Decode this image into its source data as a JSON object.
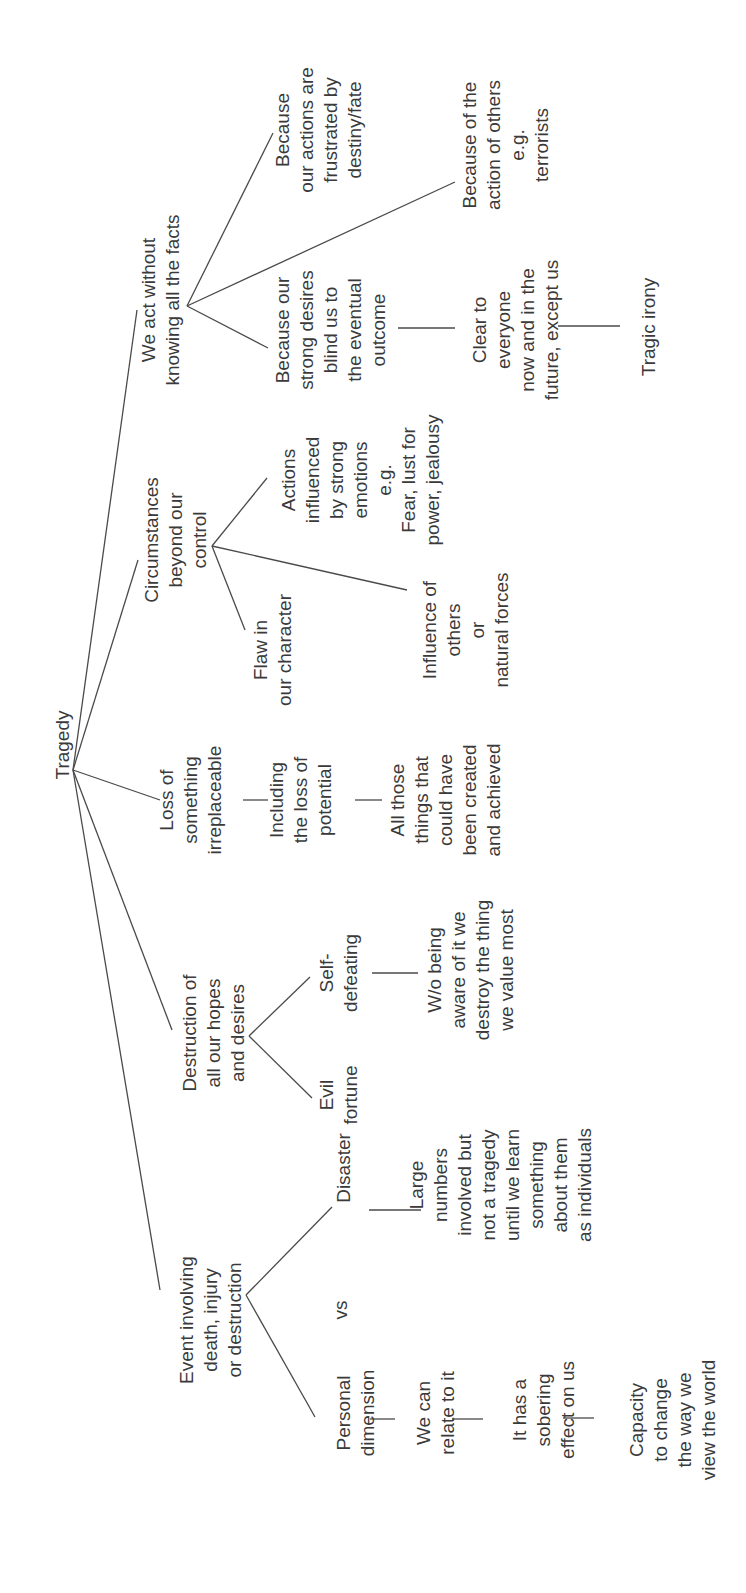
{
  "title": "Tragedy",
  "colors": {
    "ink": "#3a3a3a",
    "line": "#4a4a4a",
    "background": "#ffffff"
  },
  "orientation": "rotated-90-ccw",
  "nodes": [
    {
      "id": "root",
      "lines": [
        "Tragedy"
      ],
      "x": 62,
      "y": 745
    },
    {
      "id": "we-act",
      "lines": [
        "We act without",
        "knowing all the facts"
      ],
      "x": 160,
      "y": 300
    },
    {
      "id": "because-actions",
      "lines": [
        "Because",
        "our actions are",
        "frustrated by",
        "destiny/fate"
      ],
      "x": 318,
      "y": 130
    },
    {
      "id": "because-others",
      "lines": [
        "Because of the",
        "action of others",
        "e.g.",
        "terrorists"
      ],
      "x": 505,
      "y": 145
    },
    {
      "id": "because-desires",
      "lines": [
        "Because our",
        "strong desires",
        "blind us to",
        "the eventual",
        "outcome"
      ],
      "x": 330,
      "y": 330
    },
    {
      "id": "clear-to-everyone",
      "lines": [
        "Clear to",
        "everyone",
        "now and in the",
        "future, except us"
      ],
      "x": 515,
      "y": 330
    },
    {
      "id": "tragic-irony",
      "lines": [
        "Tragic irony"
      ],
      "x": 648,
      "y": 327
    },
    {
      "id": "circumstances",
      "lines": [
        "Circumstances",
        "beyond our",
        "control"
      ],
      "x": 175,
      "y": 540
    },
    {
      "id": "actions-influenced",
      "lines": [
        "Actions",
        "influenced",
        "by strong",
        "emotions",
        "e.g.",
        "Fear, lust for",
        "power, jealousy"
      ],
      "x": 360,
      "y": 480
    },
    {
      "id": "flaw",
      "lines": [
        "Flaw in",
        "our character"
      ],
      "x": 272,
      "y": 650
    },
    {
      "id": "influence-others",
      "lines": [
        "Influence of",
        "others",
        "or",
        "natural forces"
      ],
      "x": 465,
      "y": 630
    },
    {
      "id": "loss",
      "lines": [
        "Loss of",
        "something",
        "irreplaceable"
      ],
      "x": 190,
      "y": 800
    },
    {
      "id": "including-loss",
      "lines": [
        "Including",
        "the loss of",
        "potential"
      ],
      "x": 300,
      "y": 800
    },
    {
      "id": "all-those",
      "lines": [
        "All those",
        "things that",
        "could have",
        "been created",
        "and achieved"
      ],
      "x": 445,
      "y": 800
    },
    {
      "id": "destruction",
      "lines": [
        "Destruction of",
        "all our hopes",
        "and desires"
      ],
      "x": 213,
      "y": 1033
    },
    {
      "id": "self-defeating",
      "lines": [
        "Self-",
        "defeating"
      ],
      "x": 338,
      "y": 973
    },
    {
      "id": "evil-fortune",
      "lines": [
        "Evil",
        "fortune"
      ],
      "x": 338,
      "y": 1095
    },
    {
      "id": "wo-being-aware",
      "lines": [
        "W/o being",
        "aware of it we",
        "destroy the thing",
        "we value most"
      ],
      "x": 470,
      "y": 970
    },
    {
      "id": "event",
      "lines": [
        "Event involving",
        "death, injury",
        "or destruction"
      ],
      "x": 210,
      "y": 1320
    },
    {
      "id": "disaster",
      "lines": [
        "Disaster"
      ],
      "x": 343,
      "y": 1168
    },
    {
      "id": "vs",
      "lines": [
        "vs"
      ],
      "x": 340,
      "y": 1310
    },
    {
      "id": "large-numbers",
      "lines": [
        "Large",
        "numbers",
        "involved but",
        "not a tragedy",
        "until we learn",
        "something",
        "about them",
        "as individuals"
      ],
      "x": 500,
      "y": 1185
    },
    {
      "id": "personal-dimension",
      "lines": [
        "Personal",
        "dimension"
      ],
      "x": 355,
      "y": 1413
    },
    {
      "id": "we-can-relate",
      "lines": [
        "We can",
        "relate to it"
      ],
      "x": 435,
      "y": 1413
    },
    {
      "id": "sobering",
      "lines": [
        "It has a",
        "sobering",
        "effect on us"
      ],
      "x": 543,
      "y": 1410
    },
    {
      "id": "capacity",
      "lines": [
        "Capacity",
        "to change",
        "the way we",
        "view the world"
      ],
      "x": 672,
      "y": 1420
    }
  ],
  "edges": [
    [
      73,
      770,
      137,
      310
    ],
    [
      73,
      770,
      138,
      560
    ],
    [
      73,
      770,
      160,
      800
    ],
    [
      73,
      770,
      172,
      1030
    ],
    [
      73,
      770,
      160,
      1290
    ],
    [
      187,
      306,
      273,
      133
    ],
    [
      187,
      306,
      455,
      182
    ],
    [
      187,
      306,
      268,
      348
    ],
    [
      398,
      328,
      455,
      328
    ],
    [
      558,
      326,
      620,
      326
    ],
    [
      212,
      546,
      267,
      478
    ],
    [
      212,
      546,
      245,
      630
    ],
    [
      212,
      546,
      407,
      590
    ],
    [
      243,
      800,
      268,
      800
    ],
    [
      355,
      800,
      382,
      800
    ],
    [
      249,
      1036,
      310,
      977
    ],
    [
      249,
      1036,
      312,
      1098
    ],
    [
      372,
      973,
      418,
      973
    ],
    [
      246,
      1295,
      332,
      1207
    ],
    [
      246,
      1295,
      315,
      1417
    ],
    [
      369,
      1210,
      421,
      1210
    ],
    [
      370,
      1419,
      395,
      1419
    ],
    [
      452,
      1419,
      483,
      1419
    ],
    [
      563,
      1418,
      594,
      1418
    ]
  ]
}
